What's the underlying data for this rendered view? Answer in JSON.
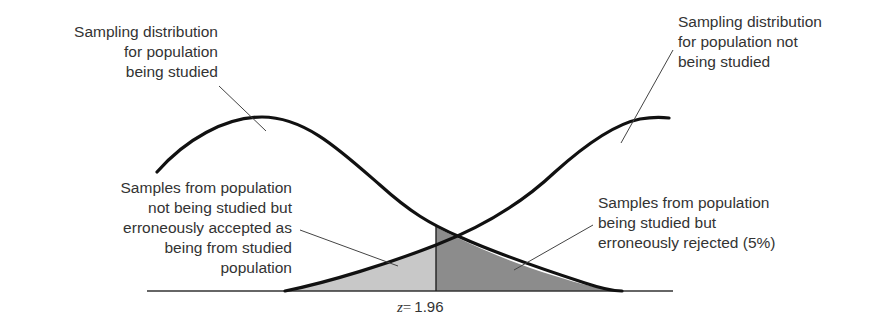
{
  "diagram": {
    "labels": {
      "left_distribution": "Sampling distribution\nfor population\nbeing studied",
      "right_distribution": "Sampling distribution\nfor population not\nbeing studied",
      "accepted_region": "Samples from population\nnot being studied but\nerroneously accepted as\nbeing from studied\npopulation",
      "rejected_region": "Samples from population\nbeing studied but\nerroneously rejected (5%)"
    },
    "critical_value": {
      "variable": "z",
      "equals": "=",
      "value": "1.96"
    },
    "colors": {
      "curve": "#111111",
      "light_region": "#c8c8c8",
      "dark_region": "#8c8c8c",
      "baseline": "#333333",
      "leader": "#444444"
    }
  }
}
